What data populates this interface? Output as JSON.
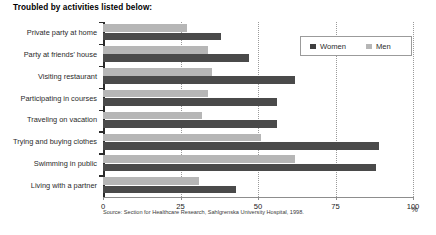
{
  "chart_data": {
    "type": "bar",
    "orientation": "horizontal",
    "title": "Troubled by activities listed below:",
    "xlabel": "%",
    "ylabel": "",
    "xlim": [
      0,
      100
    ],
    "xticks": [
      0,
      25,
      50,
      75,
      100
    ],
    "xticklabels": [
      "0",
      "25",
      "50",
      "75",
      "100"
    ],
    "grid": "vertical-dotted",
    "legend_position": "top-right",
    "categories": [
      "Private party at home",
      "Party at friends' house",
      "Visiting restaurant",
      "Participating in courses",
      "Traveling on vacation",
      "Trying and buying clothes",
      "Swimming in public",
      "Living with a partner"
    ],
    "series": [
      {
        "name": "Men",
        "color": "#b6b6b6",
        "values": [
          27,
          34,
          35,
          34,
          32,
          51,
          62,
          31
        ]
      },
      {
        "name": "Women",
        "color": "#4a4a4a",
        "values": [
          38,
          47,
          62,
          56,
          56,
          89,
          88,
          43
        ]
      }
    ],
    "source": "Source: Section for Healthcare Research, Sahlgrenska University Hospital, 1998."
  },
  "legend": {
    "items": [
      {
        "label": "Women",
        "color": "#3f3f3f"
      },
      {
        "label": "Men",
        "color": "#b6b6b6"
      }
    ]
  }
}
